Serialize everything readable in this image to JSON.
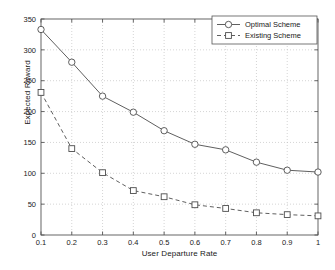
{
  "chart_data": {
    "type": "line",
    "title": "",
    "xlabel": "User Departure Rate",
    "ylabel": "Expected Reward",
    "x": [
      0.1,
      0.2,
      0.3,
      0.4,
      0.5,
      0.6,
      0.7,
      0.8,
      0.9,
      1.0
    ],
    "xticklabels": [
      "0.1",
      "0.2",
      "0.3",
      "0.4",
      "0.5",
      "0.6",
      "0.7",
      "0.8",
      "0.9",
      "1"
    ],
    "yticklabels": [
      "0",
      "50",
      "100",
      "150",
      "200",
      "250",
      "300",
      "350"
    ],
    "yticks": [
      0,
      50,
      100,
      150,
      200,
      250,
      300,
      350
    ],
    "xlim": [
      0.1,
      1.0
    ],
    "ylim": [
      0,
      350
    ],
    "grid": true,
    "grid_style": "dotted",
    "legend_position": "top-right",
    "series": [
      {
        "name": "Optimal Scheme",
        "marker": "circle",
        "linestyle": "solid",
        "color": "#4d4d4d",
        "values": [
          333,
          280,
          225,
          199,
          169,
          147,
          138,
          118,
          105,
          102
        ]
      },
      {
        "name": "Existing Scheme",
        "marker": "square",
        "linestyle": "dashed",
        "color": "#4d4d4d",
        "values": [
          231,
          140,
          101,
          72,
          62,
          49,
          43,
          36,
          33,
          31
        ]
      }
    ]
  },
  "legend": {
    "items": [
      {
        "label": "Optimal Scheme"
      },
      {
        "label": "Existing Scheme"
      }
    ]
  },
  "axes": {
    "x_title": "User Departure Rate",
    "y_title": "Expected Reward"
  }
}
